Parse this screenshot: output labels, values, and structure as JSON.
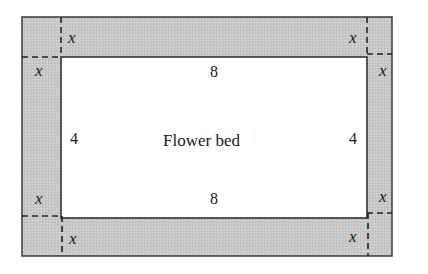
{
  "diagram": {
    "type": "geometry-figure",
    "inner_label": "Flower bed",
    "dimensions": {
      "top_length": "8",
      "bottom_length": "8",
      "left_width": "4",
      "right_width": "4"
    },
    "border_variable": "x",
    "corner_labels": {
      "top_left_horizontal": "x",
      "top_left_vertical": "x",
      "top_right_horizontal": "x",
      "top_right_vertical": "x",
      "bottom_left_horizontal": "x",
      "bottom_left_vertical": "x",
      "bottom_right_horizontal": "x",
      "bottom_right_vertical": "x"
    },
    "colors": {
      "border_fill": "#c8c8c8",
      "inner_fill": "#ffffff",
      "stroke": "#333333"
    }
  }
}
